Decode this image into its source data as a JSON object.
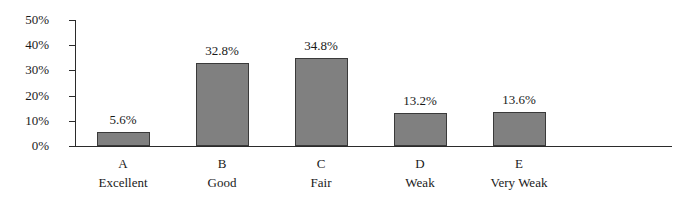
{
  "chart_data": {
    "type": "bar",
    "title": "",
    "subtitle": "",
    "xlabel": "",
    "ylabel": "",
    "categories": [
      "A",
      "B",
      "C",
      "D",
      "E"
    ],
    "category_sublabels": [
      "Excellent",
      "Good",
      "Fair",
      "Weak",
      "Very Weak"
    ],
    "values": [
      5.6,
      32.8,
      34.8,
      13.2,
      13.6
    ],
    "value_labels": [
      "5.6%",
      "32.8%",
      "34.8%",
      "13.2%",
      "13.6%"
    ],
    "ylim": [
      0,
      50
    ],
    "y_ticks": [
      0,
      10,
      20,
      30,
      40,
      50
    ],
    "y_tick_labels": [
      "0%",
      "10%",
      "20%",
      "30%",
      "40%",
      "50%"
    ],
    "grid": false,
    "legend": false,
    "legend_position": "none",
    "bar_fill_color": "#808080",
    "bar_border_color": "#3a3a3a",
    "axis_color": "#2b2b2b",
    "background_color": "#ffffff"
  }
}
